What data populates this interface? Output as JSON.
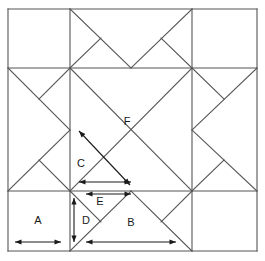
{
  "figure": {
    "type": "geometric-diagram",
    "background_color": "#ffffff",
    "line_color": "#555555",
    "arrow_color": "#1a1a1a",
    "label_color": "#1a1a1a",
    "line_width": 1.1
  },
  "frame": {
    "left": 8,
    "top": 9,
    "right": 257,
    "bottom": 251,
    "grid_x": [
      8,
      70,
      192,
      257
    ],
    "grid_y": [
      9,
      68,
      191,
      251
    ]
  },
  "labels": [
    {
      "id": "A",
      "text": "A",
      "x": 38,
      "y": 221,
      "piece": "corner-square"
    },
    {
      "id": "B",
      "text": "B",
      "x": 131,
      "y": 223,
      "piece": "large-triangle"
    },
    {
      "id": "C",
      "text": "C",
      "x": 81,
      "y": 164,
      "piece": "medium-triangle"
    },
    {
      "id": "D",
      "text": "D",
      "x": 86,
      "y": 221,
      "piece": "small-triangle"
    },
    {
      "id": "E",
      "text": "E",
      "x": 100,
      "y": 202,
      "piece": "small-triangle"
    },
    {
      "id": "F",
      "text": "F",
      "x": 127,
      "y": 122,
      "piece": "center-square"
    }
  ],
  "dimension_arrows": [
    {
      "id": "A",
      "orientation": "horizontal",
      "x1": 15,
      "y1": 242,
      "x2": 61,
      "y2": 242
    },
    {
      "id": "B",
      "orientation": "horizontal",
      "x1": 86,
      "y1": 242,
      "x2": 176,
      "y2": 242
    },
    {
      "id": "C",
      "orientation": "horizontal",
      "x1": 79,
      "y1": 182,
      "x2": 131,
      "y2": 182
    },
    {
      "id": "E",
      "orientation": "horizontal",
      "x1": 86,
      "y1": 194,
      "x2": 131,
      "y2": 194
    },
    {
      "id": "D",
      "orientation": "vertical",
      "x1": 74,
      "y1": 198,
      "x2": 74,
      "y2": 242
    },
    {
      "id": "F",
      "orientation": "diagonal",
      "x1": 79,
      "y1": 131,
      "x2": 130,
      "y2": 185
    }
  ],
  "grid_lines": [
    {
      "id": "outer-top",
      "x1": 8,
      "y1": 9,
      "x2": 257,
      "y2": 9
    },
    {
      "id": "outer-bottom",
      "x1": 8,
      "y1": 251,
      "x2": 257,
      "y2": 251
    },
    {
      "id": "outer-left",
      "x1": 8,
      "y1": 9,
      "x2": 8,
      "y2": 251
    },
    {
      "id": "outer-right",
      "x1": 257,
      "y1": 9,
      "x2": 257,
      "y2": 251
    },
    {
      "id": "inner-horiz-1",
      "x1": 8,
      "y1": 68,
      "x2": 257,
      "y2": 68
    },
    {
      "id": "inner-horiz-2",
      "x1": 8,
      "y1": 191,
      "x2": 257,
      "y2": 191
    },
    {
      "id": "inner-vert-1",
      "x1": 70,
      "y1": 9,
      "x2": 70,
      "y2": 251
    },
    {
      "id": "inner-vert-2",
      "x1": 192,
      "y1": 9,
      "x2": 192,
      "y2": 251
    }
  ],
  "diagonal_lines": [
    {
      "id": "center-diag-nw-se",
      "x1": 70,
      "y1": 68,
      "x2": 192,
      "y2": 191
    },
    {
      "id": "center-diag-ne-sw",
      "x1": 192,
      "y1": 68,
      "x2": 70,
      "y2": 191
    },
    {
      "id": "top-diag-left",
      "x1": 70,
      "y1": 9,
      "x2": 131,
      "y2": 68
    },
    {
      "id": "top-diag-right",
      "x1": 192,
      "y1": 9,
      "x2": 131,
      "y2": 68
    },
    {
      "id": "top-half-left",
      "x1": 70,
      "y1": 68,
      "x2": 101,
      "y2": 38
    },
    {
      "id": "top-half-right",
      "x1": 192,
      "y1": 68,
      "x2": 161,
      "y2": 38
    },
    {
      "id": "bot-diag-left",
      "x1": 70,
      "y1": 251,
      "x2": 131,
      "y2": 191
    },
    {
      "id": "bot-diag-right",
      "x1": 192,
      "y1": 251,
      "x2": 131,
      "y2": 191
    },
    {
      "id": "bot-half-left",
      "x1": 70,
      "y1": 191,
      "x2": 101,
      "y2": 222
    },
    {
      "id": "bot-half-right",
      "x1": 192,
      "y1": 191,
      "x2": 161,
      "y2": 222
    },
    {
      "id": "left-diag-top",
      "x1": 8,
      "y1": 68,
      "x2": 70,
      "y2": 130
    },
    {
      "id": "left-diag-bot",
      "x1": 8,
      "y1": 191,
      "x2": 70,
      "y2": 130
    },
    {
      "id": "left-half-top",
      "x1": 70,
      "y1": 68,
      "x2": 39,
      "y2": 99
    },
    {
      "id": "left-half-bot",
      "x1": 70,
      "y1": 191,
      "x2": 39,
      "y2": 160
    },
    {
      "id": "right-diag-top",
      "x1": 257,
      "y1": 68,
      "x2": 192,
      "y2": 130
    },
    {
      "id": "right-diag-bot",
      "x1": 257,
      "y1": 191,
      "x2": 192,
      "y2": 130
    },
    {
      "id": "right-half-top",
      "x1": 192,
      "y1": 68,
      "x2": 224,
      "y2": 99
    },
    {
      "id": "right-half-bot",
      "x1": 192,
      "y1": 191,
      "x2": 224,
      "y2": 160
    }
  ]
}
